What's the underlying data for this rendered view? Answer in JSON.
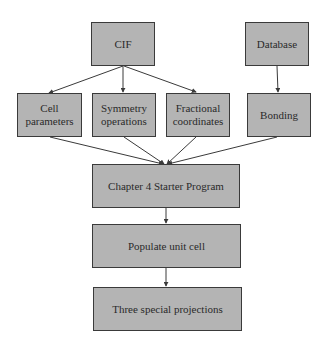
{
  "diagram": {
    "nodes": [
      {
        "id": "cif",
        "label": "CIF"
      },
      {
        "id": "database",
        "label": "Database"
      },
      {
        "id": "cell",
        "label": "Cell\nparameters"
      },
      {
        "id": "symmetry",
        "label": "Symmetry\noperations"
      },
      {
        "id": "fractional",
        "label": "Fractional\ncoordinates"
      },
      {
        "id": "bonding",
        "label": "Bonding"
      },
      {
        "id": "starter",
        "label": "Chapter 4 Starter Program"
      },
      {
        "id": "populate",
        "label": "Populate unit cell"
      },
      {
        "id": "projections",
        "label": "Three special projections"
      }
    ],
    "edges": [
      {
        "from": "cif",
        "to": "cell"
      },
      {
        "from": "cif",
        "to": "symmetry"
      },
      {
        "from": "cif",
        "to": "fractional"
      },
      {
        "from": "database",
        "to": "bonding"
      },
      {
        "from": "cell",
        "to": "starter"
      },
      {
        "from": "symmetry",
        "to": "starter"
      },
      {
        "from": "fractional",
        "to": "starter"
      },
      {
        "from": "bonding",
        "to": "starter"
      },
      {
        "from": "starter",
        "to": "populate"
      },
      {
        "from": "populate",
        "to": "projections"
      }
    ],
    "colors": {
      "box_fill": "#b4b4b4",
      "box_border": "#3a3a3a",
      "text": "#2a2a2a",
      "edge": "#3a3a3a"
    }
  }
}
